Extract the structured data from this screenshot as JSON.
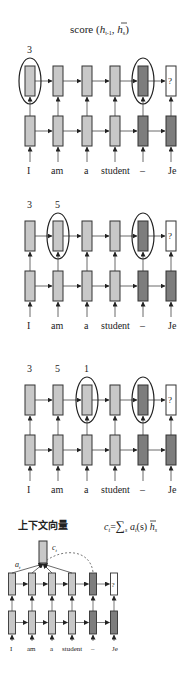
{
  "title": {
    "text": "score (",
    "h1": "h",
    "h1_sub": "t-1",
    "sep": ", ",
    "h2": "h",
    "h2_sub": "s",
    "close": ")"
  },
  "tokens": [
    "I",
    "am",
    "a",
    "student",
    "–",
    "Je"
  ],
  "question_mark": "?",
  "colors": {
    "light": "#c8c8c8",
    "dark": "#7d7d7d",
    "empty": "#ffffff",
    "border": "#333333",
    "line": "#444444"
  },
  "panels": [
    {
      "scores": [
        "3"
      ],
      "highlight_source": 0
    },
    {
      "scores": [
        "3",
        "5"
      ],
      "highlight_source": 1
    },
    {
      "scores": [
        "3",
        "5",
        "1"
      ],
      "highlight_source": 2
    }
  ],
  "context": {
    "heading": "上下文向量",
    "box_label": "c",
    "box_label_sub": "t",
    "weight_label": "a",
    "weight_label_sub": "t",
    "formula": {
      "lhs": "c",
      "lhs_sub": "t",
      "eq": "=",
      "sum": "∑",
      "sum_sub": "s",
      "a": " a",
      "a_sub": "t",
      "args": "(s) ",
      "h": "h",
      "h_sub": "s"
    }
  }
}
